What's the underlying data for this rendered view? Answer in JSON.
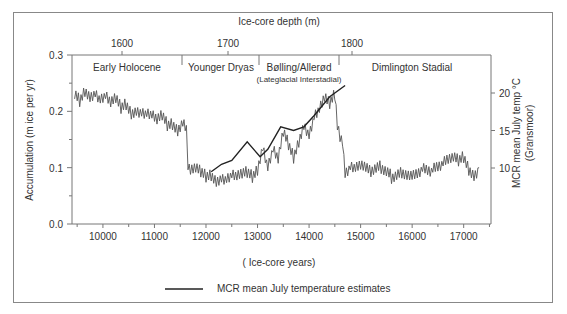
{
  "chart_data": {
    "type": "line",
    "title": "",
    "top_axis_label": "Ice-core depth (m)",
    "top_ticks": [
      1600,
      1700,
      1800
    ],
    "xlabel": "( Ice-core years)",
    "ylabel": "Accumulation (m ice per yr)",
    "y2label": "MCR mean July temp °C",
    "y2sublabel": "(Gransmoor)",
    "x_ticks": [
      10000,
      11000,
      12000,
      13000,
      14000,
      15000,
      16000,
      17000
    ],
    "y_ticks": [
      "0.0",
      "0.1",
      "0.2",
      "0.3"
    ],
    "y2_ticks": [
      10,
      15,
      20
    ],
    "xlim": [
      9400,
      17530
    ],
    "ylim": [
      0.0,
      0.3
    ],
    "y2lim": [
      10,
      20
    ],
    "grid": false,
    "periods": [
      {
        "name": "Early Holocene",
        "sub": ""
      },
      {
        "name": "Younger Dryas",
        "sub": ""
      },
      {
        "name": "Bølling/Allerød",
        "sub": "(Lateglacial Interstadial)"
      },
      {
        "name": "Dimlington Stadial",
        "sub": ""
      }
    ],
    "series": [
      {
        "name": "Accumulation",
        "x": [
          9450,
          9550,
          9650,
          9750,
          9850,
          9950,
          10050,
          10150,
          10250,
          10350,
          10450,
          10550,
          10650,
          10750,
          10850,
          10950,
          11050,
          11150,
          11250,
          11350,
          11450,
          11550,
          11620,
          11650,
          11700,
          11800,
          11900,
          12000,
          12100,
          12200,
          12300,
          12400,
          12500,
          12600,
          12700,
          12800,
          12900,
          13000,
          13050,
          13100,
          13200,
          13300,
          13400,
          13500,
          13600,
          13700,
          13800,
          13900,
          14000,
          14100,
          14200,
          14300,
          14400,
          14500,
          14550,
          14600,
          14650,
          14700,
          14800,
          14900,
          15000,
          15200,
          15400,
          15600,
          15800,
          16000,
          16200,
          16400,
          16600,
          16800,
          16900,
          17000,
          17100,
          17200,
          17300
        ],
        "values": [
          0.23,
          0.22,
          0.24,
          0.23,
          0.235,
          0.22,
          0.225,
          0.21,
          0.22,
          0.205,
          0.215,
          0.2,
          0.205,
          0.2,
          0.195,
          0.19,
          0.18,
          0.19,
          0.175,
          0.18,
          0.17,
          0.185,
          0.175,
          0.1,
          0.09,
          0.095,
          0.09,
          0.085,
          0.09,
          0.08,
          0.085,
          0.08,
          0.085,
          0.08,
          0.085,
          0.09,
          0.085,
          0.1,
          0.12,
          0.14,
          0.1,
          0.13,
          0.11,
          0.16,
          0.14,
          0.12,
          0.15,
          0.18,
          0.16,
          0.19,
          0.2,
          0.22,
          0.21,
          0.23,
          0.18,
          0.16,
          0.15,
          0.09,
          0.1,
          0.095,
          0.1,
          0.09,
          0.1,
          0.085,
          0.095,
          0.09,
          0.1,
          0.095,
          0.105,
          0.115,
          0.11,
          0.12,
          0.1,
          0.09,
          0.1
        ]
      },
      {
        "name": "MCR mean July temperature estimates",
        "axis": "right",
        "x": [
          12100,
          12300,
          12500,
          12800,
          13050,
          13200,
          13450,
          13700,
          13900,
          14100,
          14400,
          14700
        ],
        "values": [
          9.5,
          10.5,
          11,
          13.5,
          11.5,
          12.5,
          15.5,
          15,
          15.5,
          17,
          19.5,
          21
        ]
      }
    ],
    "legend": {
      "label": "MCR mean July temperature estimates",
      "position": "bottom"
    }
  }
}
